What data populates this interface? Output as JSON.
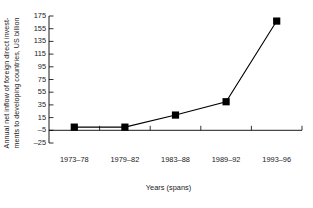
{
  "chart_data": {
    "type": "line",
    "title": "",
    "subtitle": "",
    "categories": [
      "1973–78",
      "1979–82",
      "1983–88",
      "1989–92",
      "1993–96"
    ],
    "values": [
      0,
      0,
      19,
      40,
      167
    ],
    "xlabel": "Years (spans)",
    "ylabel_line1": "Annual net inflow of foreign direct invest-",
    "ylabel_line2": "ments to developing countries, US billion",
    "yticks": [
      175,
      155,
      135,
      115,
      95,
      75,
      55,
      35,
      15,
      -5,
      -25
    ],
    "ytick_labels": [
      "175",
      "155",
      "135",
      "115",
      "95",
      "75",
      "55",
      "35",
      "15",
      "–5",
      "–25"
    ],
    "ylim": [
      -25,
      175
    ],
    "ystep": 20,
    "grid": false,
    "legend": false,
    "legend_position": "none",
    "marker": "filled-square",
    "line_color": "#000000",
    "marker_color": "#000000",
    "axis_color": "#000000",
    "background_color": "#ffffff"
  }
}
